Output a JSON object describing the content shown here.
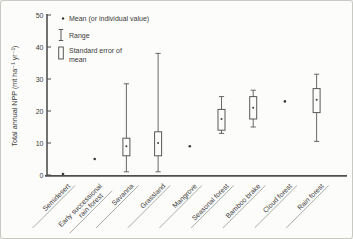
{
  "figure": {
    "kind": "scanned textbook box-plot figure",
    "colors": {
      "ink": "#3b3b3b",
      "axis": "#4f4f4f",
      "plot_stroke": "#585858",
      "box_fill": "#fcfcfa",
      "leader_line": "#9b9b96",
      "background": "#fcfcfa",
      "frame": "#c9c9c3"
    }
  },
  "chart_data": {
    "type": "boxplot",
    "title": "",
    "ylabel": "Total annual NPP (mt ha⁻¹ yr⁻¹)",
    "xlabel": "",
    "ylim": [
      0,
      50
    ],
    "yticks": [
      0,
      10,
      20,
      30,
      40,
      50
    ],
    "grid": false,
    "legend_position": "top-left-inside",
    "legend": [
      {
        "icon": "mean-dot",
        "label": "Mean (or individual value)"
      },
      {
        "icon": "range-bar",
        "label": "Range"
      },
      {
        "icon": "se-box",
        "label": "Standard error of",
        "label2": "mean"
      }
    ],
    "categories": [
      "Semidesert",
      "Early successional\nrain forest",
      "Savanna",
      "Grassland",
      "Mangrove",
      "Seasonal forest",
      "Bamboo brake",
      "Cloud forest",
      "Rain forest"
    ],
    "series": [
      {
        "category": "Semidesert",
        "mean": 0.3
      },
      {
        "category": "Early successional rain forest",
        "mean": 5
      },
      {
        "category": "Savanna",
        "mean": 9,
        "se": [
          6,
          11.5
        ],
        "range": [
          1,
          28.5
        ]
      },
      {
        "category": "Grassland",
        "mean": 10,
        "se": [
          6,
          13.5
        ],
        "range": [
          1,
          38
        ]
      },
      {
        "category": "Mangrove",
        "mean": 9
      },
      {
        "category": "Seasonal forest",
        "mean": 17.5,
        "se": [
          14,
          20.5
        ],
        "range": [
          13,
          24.5
        ]
      },
      {
        "category": "Bamboo brake",
        "mean": 21,
        "se": [
          17.5,
          24.5
        ],
        "range": [
          15,
          26.5
        ]
      },
      {
        "category": "Cloud forest",
        "mean": 23
      },
      {
        "category": "Rain forest",
        "mean": 23.5,
        "se": [
          19.5,
          27
        ],
        "range": [
          10.5,
          31.5
        ]
      }
    ],
    "units": "mt ha⁻¹ yr⁻¹"
  }
}
